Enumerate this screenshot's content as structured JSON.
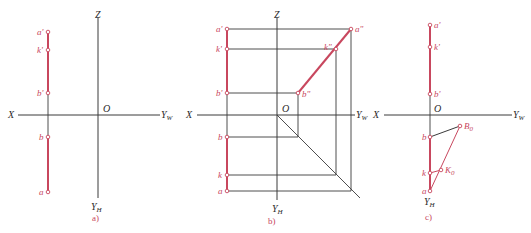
{
  "figure": {
    "panels": [
      {
        "id": "a",
        "caption": "a)",
        "axes": {
          "x_label": "X",
          "z_label": "Z",
          "yw_label": "Y",
          "yw_sub": "W",
          "yh_label": "Y",
          "yh_sub": "H",
          "origin_label": "O"
        },
        "points": {
          "a_prime": "a'",
          "k_prime": "k'",
          "b_prime": "b'",
          "b": "b",
          "a": "a"
        }
      },
      {
        "id": "b",
        "caption": "b)",
        "axes": {
          "x_label": "X",
          "z_label": "Z",
          "yw_label": "Y",
          "yw_sub": "W",
          "yh_label": "Y",
          "yh_sub": "H",
          "origin_label": "O"
        },
        "points": {
          "a_prime": "a'",
          "k_prime": "k'",
          "b_prime": "b'",
          "b": "b",
          "k": "k",
          "a": "a",
          "a_dprime": "a\"",
          "k_dprime": "k\"",
          "b_dprime": "b\""
        }
      },
      {
        "id": "c",
        "caption": "c)",
        "axes": {
          "x_label": "X",
          "yw_label": "Y",
          "yw_sub": "W",
          "yh_label": "Y",
          "yh_sub": "H",
          "origin_label": "O"
        },
        "points": {
          "a_prime": "a'",
          "k_prime": "k'",
          "b_prime": "b'",
          "b": "b",
          "k": "k",
          "a": "a",
          "B0": "B",
          "B0_sub": "0",
          "K0": "K",
          "K0_sub": "0"
        }
      }
    ],
    "colors": {
      "projection_line": "#c8475e",
      "axis": "#3a3a3a",
      "background": "#ffffff"
    }
  }
}
